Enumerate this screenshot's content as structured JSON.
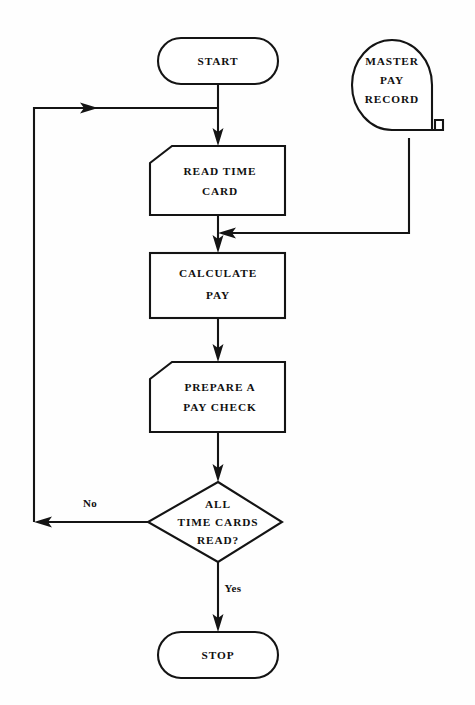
{
  "diagram": {
    "background_color": "#fefefe",
    "line_color": "#141414",
    "nodes": {
      "start": {
        "id": "start",
        "shape": "terminator",
        "label": "START"
      },
      "master_pay_record": {
        "id": "master_pay_record",
        "shape": "magnetic-tape",
        "label_line_1": "MASTER",
        "label_line_2": "PAY",
        "label_line_3": "RECORD"
      },
      "read_time_card": {
        "id": "read_time_card",
        "shape": "punched-card",
        "label_line_1": "READ TIME",
        "label_line_2": "CARD"
      },
      "calculate_pay": {
        "id": "calculate_pay",
        "shape": "process",
        "label_line_1": "CALCULATE",
        "label_line_2": "PAY"
      },
      "prepare_pay_check": {
        "id": "prepare_pay_check",
        "shape": "punched-card",
        "label_line_1": "PREPARE A",
        "label_line_2": "PAY CHECK"
      },
      "all_time_cards_read": {
        "id": "all_time_cards_read",
        "shape": "decision",
        "label_line_1": "ALL",
        "label_line_2": "TIME CARDS",
        "label_line_3": "READ?"
      },
      "stop": {
        "id": "stop",
        "shape": "terminator",
        "label": "STOP"
      }
    },
    "edges": {
      "decision_no": {
        "label": "No",
        "from": "all_time_cards_read",
        "to": "read_time_card"
      },
      "decision_yes": {
        "label": "Yes",
        "from": "all_time_cards_read",
        "to": "stop"
      }
    }
  }
}
